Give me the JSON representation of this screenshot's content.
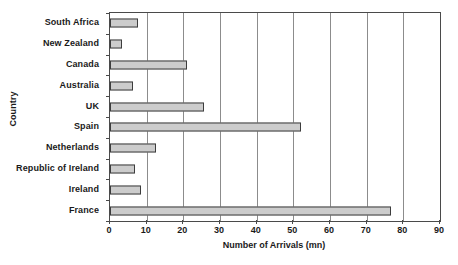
{
  "chart_data": {
    "type": "bar",
    "orientation": "horizontal",
    "title": "",
    "xlabel": "Number of Arrivals (mn)",
    "ylabel": "Country",
    "xlim": [
      0,
      90
    ],
    "xticks": [
      0,
      10,
      20,
      30,
      40,
      50,
      60,
      70,
      80,
      90
    ],
    "grid": true,
    "legend": null,
    "categories": [
      "South Africa",
      "New Zealand",
      "Canada",
      "Australia",
      "UK",
      "Spain",
      "Netherlands",
      "Republic of Ireland",
      "Ireland",
      "France"
    ],
    "values": [
      7.5,
      3.2,
      21.0,
      6.2,
      25.5,
      52.0,
      12.5,
      6.9,
      8.5,
      76.5
    ],
    "bar_fill_color": "#cccccc",
    "bar_edge_color": "#3d3d3d",
    "grid_color": "#8c8c8c",
    "axis_color": "#4a4a4a",
    "background_color": "#ffffff"
  }
}
